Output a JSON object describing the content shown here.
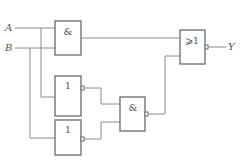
{
  "diagram": {
    "type": "logic-circuit",
    "inputs": [
      {
        "id": "A",
        "label": "A"
      },
      {
        "id": "B",
        "label": "B"
      }
    ],
    "output": {
      "id": "Y",
      "label": "Y"
    },
    "gates": [
      {
        "id": "g1",
        "kind": "AND",
        "symbol": "&",
        "inputs": [
          "A",
          "B"
        ]
      },
      {
        "id": "g2",
        "kind": "NOT",
        "symbol": "1",
        "inputs": [
          "A"
        ]
      },
      {
        "id": "g3",
        "kind": "NOT",
        "symbol": "1",
        "inputs": [
          "B"
        ]
      },
      {
        "id": "g4",
        "kind": "NAND",
        "symbol": "&",
        "inputs": [
          "g2",
          "g3"
        ]
      },
      {
        "id": "g5",
        "kind": "NOR",
        "symbol": "⩾1",
        "inputs": [
          "g1",
          "g4"
        ],
        "output": "Y"
      }
    ],
    "colors": {
      "line": "#8a8a8a",
      "gate_border": "#6a6a6a",
      "text": "#555555"
    }
  }
}
